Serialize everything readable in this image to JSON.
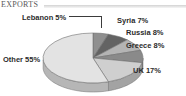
{
  "header": {
    "title": "EXPORTS",
    "rule_icon": "horizontal-rule"
  },
  "chart_data": {
    "type": "pie",
    "title": "EXPORTS",
    "xlabel": "",
    "ylabel": "",
    "units": "percent",
    "three_d": true,
    "legend_position": "none",
    "labels_position": "outside",
    "categories": [
      "Lebanon",
      "Syria",
      "Russia",
      "Greece",
      "UK",
      "Other"
    ],
    "values": [
      5,
      7,
      8,
      8,
      17,
      55
    ],
    "slices": [
      {
        "label": "Lebanon",
        "value": 5,
        "label_text": "Lebanon 5%",
        "color": "#8f8f8f",
        "side_color": "#6e6e6e"
      },
      {
        "label": "Syria",
        "value": 7,
        "label_text": "Syria 7%",
        "color": "#636363",
        "side_color": "#4b4b4b"
      },
      {
        "label": "Russia",
        "value": 8,
        "label_text": "Russia 8%",
        "color": "#b4b4b4",
        "side_color": "#8c8c8c"
      },
      {
        "label": "Greece",
        "value": 8,
        "label_text": "Greece 8%",
        "color": "#8a8a8a",
        "side_color": "#696969"
      },
      {
        "label": "UK",
        "value": 17,
        "label_text": "UK 17%",
        "color": "#cfcfcf",
        "side_color": "#a3a3a3"
      },
      {
        "label": "Other",
        "value": 55,
        "label_text": "Other 55%",
        "color": "#e3e3e3",
        "side_color": "#b6b6b6"
      }
    ],
    "total": 100,
    "outline_color": "#707070",
    "background": "#ffffff"
  }
}
